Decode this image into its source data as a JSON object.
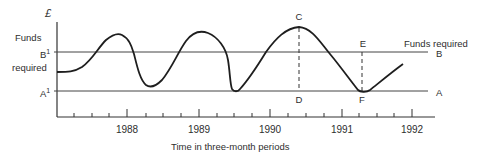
{
  "diagram": {
    "y_axis_symbol": "£",
    "left_labels": {
      "funds": "Funds",
      "required": "required",
      "b_prime": "B",
      "a_prime": "A",
      "prime_mark": "1"
    },
    "right_labels": {
      "funds_required": "Funds required",
      "b": "B",
      "a": "A"
    },
    "points": {
      "c": "C",
      "d": "D",
      "e": "E",
      "f": "F"
    },
    "x_axis": {
      "title": "Time in three-month periods",
      "years": [
        "1988",
        "1989",
        "1990",
        "1991",
        "1992"
      ]
    },
    "colors": {
      "line": "#1e1e1e",
      "axis": "#333333",
      "reference": "#444444"
    }
  }
}
